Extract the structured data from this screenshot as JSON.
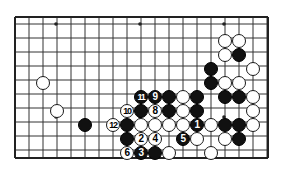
{
  "figure": {
    "kind": "go-board-diagram",
    "game": "Go",
    "background_color": "#ffffff",
    "board": {
      "line_color": "#333333",
      "border_color": "#222222",
      "cols": 19,
      "rows": 11,
      "origin_x": 15,
      "origin_y": 24,
      "spacing": 14,
      "visible_cols": 18,
      "visible_rows": 10,
      "left": 15,
      "top": 17,
      "right": 268,
      "bottom": 158,
      "star_points": [
        {
          "x": 56,
          "y": 24
        },
        {
          "x": 140,
          "y": 24
        },
        {
          "x": 224,
          "y": 24
        },
        {
          "x": 56,
          "y": 117
        },
        {
          "x": 140,
          "y": 117
        },
        {
          "x": 224,
          "y": 117
        }
      ]
    },
    "stones": [
      {
        "id": "w-c3r5",
        "color": "white",
        "x": 43,
        "y": 83,
        "label": ""
      },
      {
        "id": "w-c4r7",
        "color": "white",
        "x": 57,
        "y": 111,
        "label": ""
      },
      {
        "id": "b-c6r8",
        "color": "black",
        "x": 85,
        "y": 125,
        "label": ""
      },
      {
        "id": "w-m12",
        "color": "white",
        "x": 113,
        "y": 125,
        "label": "12"
      },
      {
        "id": "w-m10",
        "color": "white",
        "x": 127,
        "y": 111,
        "label": "10"
      },
      {
        "id": "b-m11",
        "color": "black",
        "x": 141,
        "y": 97,
        "label": "11"
      },
      {
        "id": "b-m9",
        "color": "black",
        "x": 155,
        "y": 97,
        "label": "9"
      },
      {
        "id": "b-p1",
        "color": "black",
        "x": 169,
        "y": 97,
        "label": ""
      },
      {
        "id": "b-p2",
        "color": "black",
        "x": 141,
        "y": 111,
        "label": ""
      },
      {
        "id": "w-m8",
        "color": "white",
        "x": 155,
        "y": 111,
        "label": "8"
      },
      {
        "id": "b-p3",
        "color": "black",
        "x": 169,
        "y": 111,
        "label": ""
      },
      {
        "id": "w-p4",
        "color": "white",
        "x": 183,
        "y": 111,
        "label": ""
      },
      {
        "id": "b-p5",
        "color": "black",
        "x": 127,
        "y": 125,
        "label": ""
      },
      {
        "id": "w-p6",
        "color": "white",
        "x": 141,
        "y": 125,
        "label": ""
      },
      {
        "id": "w-p7",
        "color": "white",
        "x": 155,
        "y": 125,
        "label": ""
      },
      {
        "id": "w-p8",
        "color": "white",
        "x": 169,
        "y": 125,
        "label": ""
      },
      {
        "id": "w-p9",
        "color": "white",
        "x": 183,
        "y": 125,
        "label": ""
      },
      {
        "id": "b-m1",
        "color": "black",
        "x": 197,
        "y": 125,
        "label": "1"
      },
      {
        "id": "w-p10",
        "color": "white",
        "x": 211,
        "y": 125,
        "label": ""
      },
      {
        "id": "b-p11",
        "color": "black",
        "x": 127,
        "y": 139,
        "label": ""
      },
      {
        "id": "w-m2",
        "color": "white",
        "x": 141,
        "y": 139,
        "label": "2"
      },
      {
        "id": "w-m4",
        "color": "white",
        "x": 155,
        "y": 139,
        "label": "4"
      },
      {
        "id": "b-m5",
        "color": "black",
        "x": 183,
        "y": 139,
        "label": "5"
      },
      {
        "id": "w-p12",
        "color": "white",
        "x": 197,
        "y": 139,
        "label": ""
      },
      {
        "id": "w-m6",
        "color": "white",
        "x": 127,
        "y": 153,
        "label": "6"
      },
      {
        "id": "b-m3",
        "color": "black",
        "x": 141,
        "y": 153,
        "label": "3"
      },
      {
        "id": "b-p13",
        "color": "black",
        "x": 155,
        "y": 153,
        "label": ""
      },
      {
        "id": "w-p14",
        "color": "white",
        "x": 169,
        "y": 153,
        "label": ""
      },
      {
        "id": "w-tr1",
        "color": "white",
        "x": 225,
        "y": 41,
        "label": ""
      },
      {
        "id": "w-tr2",
        "color": "white",
        "x": 239,
        "y": 41,
        "label": ""
      },
      {
        "id": "w-tr3",
        "color": "white",
        "x": 225,
        "y": 55,
        "label": ""
      },
      {
        "id": "b-tr1",
        "color": "black",
        "x": 239,
        "y": 55,
        "label": ""
      },
      {
        "id": "b-tr2",
        "color": "black",
        "x": 211,
        "y": 69,
        "label": ""
      },
      {
        "id": "w-tr4",
        "color": "white",
        "x": 253,
        "y": 69,
        "label": ""
      },
      {
        "id": "b-tr3",
        "color": "black",
        "x": 211,
        "y": 83,
        "label": ""
      },
      {
        "id": "w-tr5",
        "color": "white",
        "x": 225,
        "y": 83,
        "label": ""
      },
      {
        "id": "w-tr6",
        "color": "white",
        "x": 239,
        "y": 83,
        "label": ""
      },
      {
        "id": "b-mr1",
        "color": "black",
        "x": 197,
        "y": 97,
        "label": ""
      },
      {
        "id": "b-mr2",
        "color": "black",
        "x": 225,
        "y": 97,
        "label": ""
      },
      {
        "id": "b-mr3",
        "color": "black",
        "x": 239,
        "y": 97,
        "label": ""
      },
      {
        "id": "w-mr1",
        "color": "white",
        "x": 253,
        "y": 97,
        "label": ""
      },
      {
        "id": "w-mr2",
        "color": "white",
        "x": 183,
        "y": 97,
        "label": ""
      },
      {
        "id": "b-mr4",
        "color": "black",
        "x": 197,
        "y": 111,
        "label": ""
      },
      {
        "id": "w-mr3",
        "color": "white",
        "x": 253,
        "y": 111,
        "label": ""
      },
      {
        "id": "b-br1",
        "color": "black",
        "x": 225,
        "y": 125,
        "label": ""
      },
      {
        "id": "b-br2",
        "color": "black",
        "x": 239,
        "y": 125,
        "label": ""
      },
      {
        "id": "w-br1",
        "color": "white",
        "x": 253,
        "y": 125,
        "label": ""
      },
      {
        "id": "w-br2",
        "color": "white",
        "x": 225,
        "y": 139,
        "label": ""
      },
      {
        "id": "b-br3",
        "color": "black",
        "x": 239,
        "y": 139,
        "label": ""
      },
      {
        "id": "w-br3",
        "color": "white",
        "x": 211,
        "y": 153,
        "label": ""
      }
    ],
    "move_numbers": [
      "1",
      "2",
      "3",
      "4",
      "5",
      "6",
      "8",
      "9",
      "10",
      "11",
      "12"
    ]
  }
}
